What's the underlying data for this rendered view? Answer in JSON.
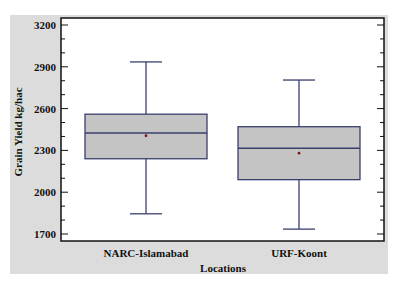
{
  "chart_data": {
    "type": "box",
    "title": "",
    "xlabel": "Locations",
    "ylabel": "Grain Yield kg/hac",
    "ylim": [
      1700,
      3200
    ],
    "yticks": [
      1700,
      2000,
      2300,
      2600,
      2900,
      3200
    ],
    "ytick_labels": [
      "1700",
      "2000",
      "2300",
      "2600",
      "2900",
      "3200"
    ],
    "minor_tick_step": 100,
    "grid": false,
    "legend": null,
    "categories": [
      "NARC-Islamabad",
      "URF-Koont"
    ],
    "series": [
      {
        "name": "NARC-Islamabad",
        "min": 1845,
        "q1": 2240,
        "median": 2425,
        "mean": 2405,
        "q3": 2560,
        "max": 2935
      },
      {
        "name": "URF-Koont",
        "min": 1735,
        "q1": 2090,
        "median": 2315,
        "mean": 2280,
        "q3": 2470,
        "max": 2805
      }
    ],
    "colors": {
      "box_fill": "#c4c4c4",
      "box_stroke": "#3a3f6e",
      "mean_marker": "#7a1a1a",
      "panel_bg": "#dcdcdc",
      "plot_bg": "#ffffff"
    }
  }
}
